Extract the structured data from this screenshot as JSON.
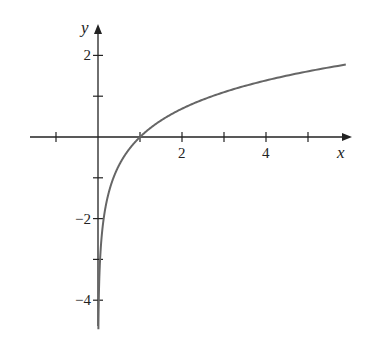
{
  "chart_data": {
    "type": "line",
    "title": "",
    "xlabel": "x",
    "ylabel": "y",
    "function": "y = ln x",
    "xlim": [
      -1.5,
      5.9
    ],
    "ylim": [
      -4.8,
      2.6
    ],
    "x_ticks": [
      -1,
      1,
      2,
      3,
      4,
      5
    ],
    "x_tick_labels": {
      "2": "2",
      "4": "4"
    },
    "y_ticks": [
      -4,
      -3,
      -2,
      -1,
      1,
      2
    ],
    "y_tick_labels": {
      "2": "2",
      "-2": "−2",
      "-4": "−4"
    },
    "grid": false,
    "series": [
      {
        "name": "ln x",
        "x": [
          0.01,
          0.05,
          0.1,
          0.2,
          0.5,
          1,
          2,
          3,
          4,
          5,
          5.9
        ],
        "y": [
          -4.61,
          -3.0,
          -2.3,
          -1.61,
          -0.69,
          0,
          0.69,
          1.1,
          1.39,
          1.61,
          1.77
        ]
      }
    ]
  }
}
